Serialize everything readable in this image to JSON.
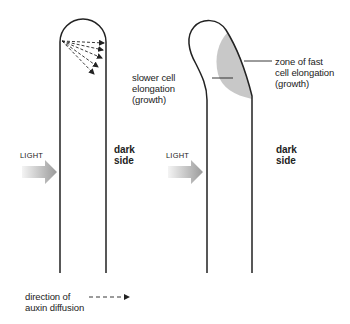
{
  "figure": {
    "panels": [
      {
        "id": "straight-shoot",
        "light_label": "LIGHT",
        "dark_label_line1": "dark",
        "dark_label_line2": "side"
      },
      {
        "id": "bending-shoot",
        "light_label": "LIGHT",
        "dark_label_line1": "dark",
        "dark_label_line2": "side",
        "slow_zone_line1": "slower cell",
        "slow_zone_line2": "elongation",
        "slow_zone_line3": "(growth)",
        "fast_zone_line1": "zone of fast",
        "fast_zone_line2": "cell elongation",
        "fast_zone_line3": "(growth)"
      }
    ],
    "legend": {
      "line1": "direction of",
      "line2": "auxin diffusion",
      "symbol": "dashed-arrow"
    }
  },
  "colors": {
    "outline": "#222222",
    "fast_zone_fill": "#c8c8c8",
    "light_arrow_start": "#f2f2f2",
    "light_arrow_end": "#9a9a9a"
  }
}
